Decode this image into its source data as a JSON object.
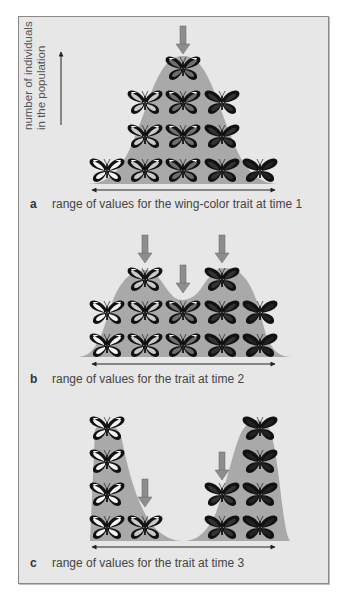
{
  "figure": {
    "y_axis_label": [
      "number of individuals",
      "in the population"
    ],
    "colors": {
      "frame_bg": "#e7e7e7",
      "distribution_fill": "#a9a9a9",
      "selection_arrow": "#8d8d8d",
      "axis": "#222222"
    },
    "panels": [
      {
        "letter": "a",
        "caption": "range of values for the wing-color trait at time 1",
        "shape": "unimodal",
        "columns": [
          {
            "shade": "white",
            "count": 1
          },
          {
            "shade": "light",
            "count": 3
          },
          {
            "shade": "medium",
            "count": 4
          },
          {
            "shade": "dark",
            "count": 3
          },
          {
            "shade": "black",
            "count": 1
          }
        ],
        "selection_arrows": [
          3
        ]
      },
      {
        "letter": "b",
        "caption": "range of values for the trait at time 2",
        "shape": "bimodal-shallow",
        "columns": [
          {
            "shade": "white",
            "count": 2
          },
          {
            "shade": "light",
            "count": 3
          },
          {
            "shade": "medium",
            "count": 2
          },
          {
            "shade": "dark",
            "count": 3
          },
          {
            "shade": "black",
            "count": 2
          }
        ],
        "selection_arrows": [
          2,
          3,
          4
        ]
      },
      {
        "letter": "c",
        "caption": "range of values for the trait at time 3",
        "shape": "bimodal-disruptive",
        "columns": [
          {
            "shade": "white",
            "count": 4
          },
          {
            "shade": "light",
            "count": 1
          },
          {
            "shade": "medium",
            "count": 0
          },
          {
            "shade": "dark",
            "count": 2
          },
          {
            "shade": "black",
            "count": 4
          }
        ],
        "selection_arrows": [
          2,
          4
        ]
      }
    ]
  },
  "chart_data": {
    "type": "diagram",
    "ylabel": "number of individuals in the population",
    "xlabel": "range of values for the trait",
    "categories": [
      "white",
      "light",
      "medium",
      "dark",
      "black"
    ],
    "series": [
      {
        "name": "time 1",
        "values": [
          1,
          3,
          4,
          3,
          1
        ]
      },
      {
        "name": "time 2",
        "values": [
          2,
          3,
          2,
          3,
          2
        ]
      },
      {
        "name": "time 3",
        "values": [
          4,
          1,
          0,
          2,
          4
        ]
      }
    ]
  }
}
